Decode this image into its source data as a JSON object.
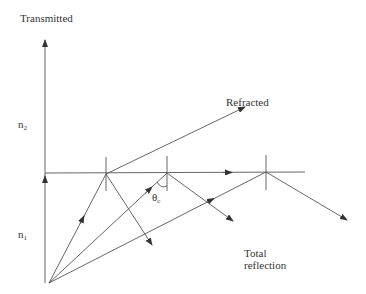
{
  "diagram": {
    "labels": {
      "transmitted": "Transmitted",
      "refracted": "Refracted",
      "n2_base": "n",
      "n2_sub": "2",
      "n1_base": "n",
      "n1_sub": "1",
      "theta_base": "θ",
      "theta_sub": "c",
      "total_line1": "Total",
      "total_line2": "reflection"
    },
    "colors": {
      "line": "#555555",
      "text": "#333333",
      "background": "#ffffff"
    }
  }
}
